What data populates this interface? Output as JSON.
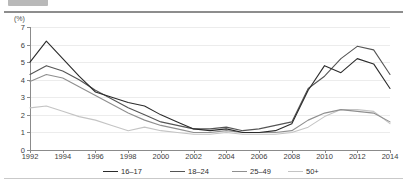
{
  "header": {
    "badge_name": "clipped-badge",
    "title": "",
    "visible": true
  },
  "axis": {
    "unit_label": "(%)",
    "y_ticks": [
      "0",
      "1",
      "2",
      "3",
      "4",
      "5",
      "6",
      "7"
    ],
    "x_ticks": [
      "1992",
      "1994",
      "1996",
      "1998",
      "2000",
      "2002",
      "2004",
      "2006",
      "2008",
      "2010",
      "2012",
      "2014"
    ]
  },
  "legend": {
    "items": [
      {
        "label": "16–17",
        "color": "#2b2b2b"
      },
      {
        "label": "18–24",
        "color": "#555555"
      },
      {
        "label": "25–49",
        "color": "#8f8f8f"
      },
      {
        "label": "50+",
        "color": "#c4c4c4"
      }
    ]
  },
  "chart_data": {
    "type": "line",
    "title": "",
    "subtitle": "",
    "xlabel": "",
    "ylabel": "(%)",
    "ylim": [
      0,
      7
    ],
    "xlim": [
      1992,
      2014
    ],
    "grid": true,
    "legend_position": "bottom",
    "x": [
      1992,
      1993,
      1994,
      1995,
      1996,
      1997,
      1998,
      1999,
      2000,
      2001,
      2002,
      2003,
      2004,
      2005,
      2006,
      2007,
      2008,
      2009,
      2010,
      2011,
      2012,
      2013,
      2014
    ],
    "series": [
      {
        "name": "16–17",
        "color": "#2b2b2b",
        "values": [
          5.0,
          6.2,
          5.2,
          4.2,
          3.3,
          3.0,
          2.7,
          2.5,
          2.0,
          1.6,
          1.2,
          1.1,
          1.2,
          1.0,
          1.0,
          1.1,
          1.5,
          3.4,
          4.8,
          4.4,
          5.2,
          4.9,
          3.5
        ]
      },
      {
        "name": "18–24",
        "color": "#555555",
        "values": [
          4.3,
          4.8,
          4.5,
          4.0,
          3.4,
          2.9,
          2.4,
          2.0,
          1.6,
          1.4,
          1.2,
          1.2,
          1.3,
          1.1,
          1.2,
          1.4,
          1.6,
          3.5,
          4.2,
          5.2,
          5.9,
          5.7,
          4.3
        ]
      },
      {
        "name": "25–49",
        "color": "#8f8f8f",
        "values": [
          3.9,
          4.3,
          4.1,
          3.6,
          3.1,
          2.6,
          2.1,
          1.7,
          1.4,
          1.2,
          1.0,
          1.0,
          1.1,
          1.0,
          1.0,
          1.0,
          1.1,
          1.7,
          2.1,
          2.3,
          2.2,
          2.1,
          1.6
        ]
      },
      {
        "name": "50+",
        "color": "#c4c4c4",
        "values": [
          2.4,
          2.5,
          2.2,
          1.9,
          1.7,
          1.4,
          1.1,
          1.3,
          1.1,
          1.0,
          0.9,
          0.9,
          1.0,
          0.9,
          0.9,
          0.9,
          1.0,
          1.3,
          1.9,
          2.3,
          2.3,
          2.2,
          1.5
        ]
      }
    ]
  }
}
